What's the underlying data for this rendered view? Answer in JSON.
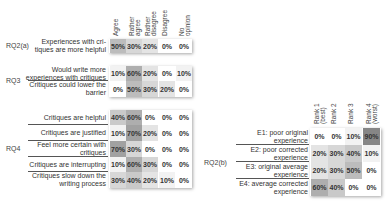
{
  "chart_data": [
    {
      "type": "heatmap",
      "title": "Likert responses (RQ2(a), RQ3, RQ4)",
      "columns": [
        "Agree",
        "Rather agree",
        "Rather disagree",
        "Disagree",
        "No opinion"
      ],
      "groups": [
        {
          "group": "RQ2(a)",
          "rows": [
            {
              "label": "Experiences with critiques are more helpful",
              "values": [
                "50%",
                "30%",
                "20%",
                "0%",
                "0%"
              ]
            }
          ]
        },
        {
          "group": "RQ3",
          "rows": [
            {
              "label": "Would write more experiences with critiques",
              "values": [
                "10%",
                "60%",
                "20%",
                "0%",
                "10%"
              ]
            },
            {
              "label": "Critiques could lower the barrier",
              "values": [
                "0%",
                "50%",
                "30%",
                "20%",
                "0%"
              ]
            }
          ]
        },
        {
          "group": "RQ4",
          "rows": [
            {
              "label": "Critiques are helpful",
              "values": [
                "40%",
                "60%",
                "0%",
                "0%",
                "0%"
              ]
            },
            {
              "label": "Critiques are justified",
              "values": [
                "10%",
                "70%",
                "20%",
                "0%",
                "0%"
              ]
            },
            {
              "label": "Feel more certain with critiques",
              "values": [
                "70%",
                "30%",
                "0%",
                "0%",
                "0%"
              ]
            },
            {
              "label": "Critiques are interrupting",
              "values": [
                "10%",
                "60%",
                "30%",
                "0%",
                "0%"
              ]
            },
            {
              "label": "Critiques slow down the writing process",
              "values": [
                "30%",
                "40%",
                "20%",
                "10%",
                "0%"
              ]
            }
          ]
        }
      ]
    },
    {
      "type": "heatmap",
      "title": "Ranking of experiences (RQ2(b))",
      "columns": [
        "Rank 1 (best)",
        "Rank 2",
        "Rank 3",
        "Rank 4 (worst)"
      ],
      "groups": [
        {
          "group": "RQ2(b)",
          "rows": [
            {
              "label": "E1: poor original experience",
              "values": [
                "0%",
                "0%",
                "10%",
                "90%"
              ]
            },
            {
              "label": "E2: poor corrected experience",
              "values": [
                "20%",
                "30%",
                "40%",
                "10%"
              ]
            },
            {
              "label": "E3: original average experience",
              "values": [
                "20%",
                "30%",
                "50%",
                "0%"
              ]
            },
            {
              "label": "E4: average corrected experience",
              "values": [
                "60%",
                "40%",
                "0%",
                "0%"
              ]
            }
          ]
        }
      ]
    }
  ],
  "left": {
    "headers": [
      "Agree",
      "Rather\nagree",
      "Rather\ndisagree",
      "Disagree",
      "No\nopinion"
    ],
    "rq2a": {
      "group": "RQ2(a)",
      "r0": {
        "label": "Experiences with cri-\ntiques are more helpful",
        "v": [
          "50%",
          "30%",
          "20%",
          "0%",
          "0%"
        ]
      }
    },
    "rq3": {
      "group": "RQ3",
      "r0": {
        "label": "Would write more\nexperiences with critiques",
        "v": [
          "10%",
          "60%",
          "20%",
          "0%",
          "10%"
        ]
      },
      "r1": {
        "label": "Critiques could lower the\nbarrier",
        "v": [
          "0%",
          "50%",
          "30%",
          "20%",
          "0%"
        ]
      }
    },
    "rq4": {
      "group": "RQ4",
      "r0": {
        "label": "Critiques are helpful",
        "v": [
          "40%",
          "60%",
          "0%",
          "0%",
          "0%"
        ]
      },
      "r1": {
        "label": "Critiques are justified",
        "v": [
          "10%",
          "70%",
          "20%",
          "0%",
          "0%"
        ]
      },
      "r2": {
        "label": "Feel more certain with\ncritiques",
        "v": [
          "70%",
          "30%",
          "0%",
          "0%",
          "0%"
        ]
      },
      "r3": {
        "label": "Critiques are interrupting",
        "v": [
          "10%",
          "60%",
          "30%",
          "0%",
          "0%"
        ]
      },
      "r4": {
        "label": "Critiques slow down the\nwriting process",
        "v": [
          "30%",
          "40%",
          "20%",
          "10%",
          "0%"
        ]
      }
    }
  },
  "right": {
    "headers": [
      "Rank 1\n(best)",
      "Rank 2",
      "Rank 3",
      "Rank 4\n(worst)"
    ],
    "group": "RQ2(b)",
    "r0": {
      "label": "E1: poor original\nexperience",
      "v": [
        "0%",
        "0%",
        "10%",
        "90%"
      ]
    },
    "r1": {
      "label": "E2: poor corrected\nexperience",
      "v": [
        "20%",
        "30%",
        "40%",
        "10%"
      ]
    },
    "r2": {
      "label": "E3: original average\nexperience",
      "v": [
        "20%",
        "30%",
        "50%",
        "0%"
      ]
    },
    "r3": {
      "label": "E4: average corrected\nexperience",
      "v": [
        "60%",
        "40%",
        "0%",
        "0%"
      ]
    }
  }
}
